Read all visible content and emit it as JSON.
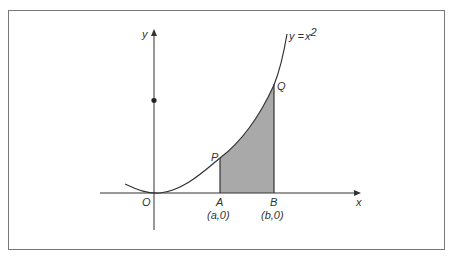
{
  "diagram": {
    "curve_label": "y = x²",
    "curve_label_parts": {
      "lhs": "y",
      "eq": " =",
      "var": "x",
      "exp": "2"
    },
    "axes": {
      "x_label": "x",
      "y_label": "y",
      "origin_label": "O"
    },
    "points": {
      "P": "P",
      "Q": "Q",
      "A": "A",
      "B": "B",
      "A_coord": "(a,0)",
      "B_coord": "(b,0)"
    },
    "shaded_region_color": "#a9a9a9",
    "line_color": "#333333"
  }
}
